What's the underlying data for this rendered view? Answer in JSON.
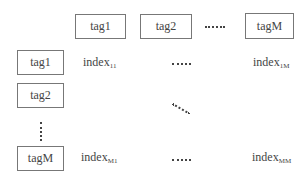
{
  "columns": {
    "headers": [
      "tag1",
      "tag2",
      "tagM"
    ],
    "ellipsis": "……"
  },
  "rows": {
    "headers": [
      "tag1",
      "tag2",
      "tagM"
    ]
  },
  "cells": {
    "r1c1": {
      "base": "index",
      "sub": "11"
    },
    "r1cM": {
      "base": "index",
      "sub": "1M"
    },
    "rMc1": {
      "base": "index",
      "sub": "M1"
    },
    "rMcM": {
      "base": "index",
      "sub": "MM"
    }
  }
}
